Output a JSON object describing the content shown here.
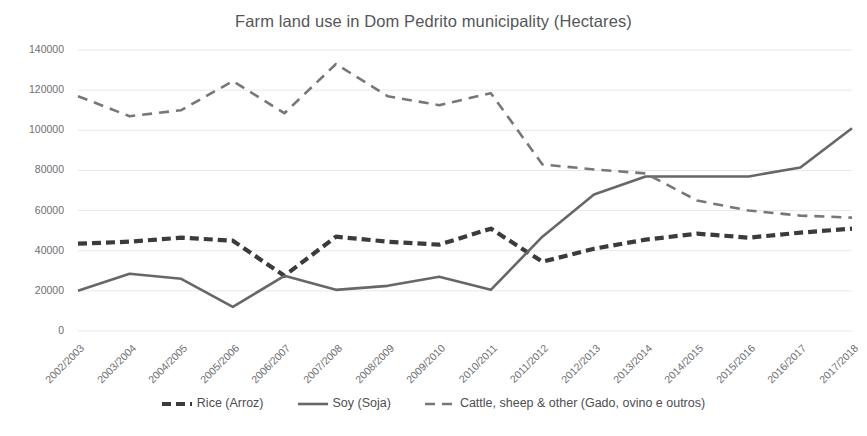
{
  "chart_data": {
    "type": "line",
    "title": "Farm land use in Dom Pedrito municipality (Hectares)",
    "xlabel": "",
    "ylabel": "",
    "ylim": [
      0,
      140000
    ],
    "ytick_step": 20000,
    "yticks": [
      "0",
      "20000",
      "40000",
      "60000",
      "80000",
      "100000",
      "120000",
      "140000"
    ],
    "grid": true,
    "legend_position": "bottom",
    "categories": [
      "2002/2003",
      "2003/2004",
      "2004/2005",
      "2005/2006",
      "2006/2007",
      "2007/2008",
      "2008/2009",
      "2009/2010",
      "2010/2011",
      "2011/2012",
      "2012/2013",
      "2013/2014",
      "2014/2015",
      "2015/2016",
      "2016/2017",
      "2017/2018"
    ],
    "series": [
      {
        "name": "Rice (Arroz)",
        "style": "dashed-thick",
        "color": "#3b3b3d",
        "values": [
          43500,
          44500,
          46500,
          45000,
          27500,
          47000,
          44500,
          43000,
          51000,
          34500,
          41000,
          45500,
          48500,
          46500,
          49000,
          51000
        ]
      },
      {
        "name": "Soy (Soja)",
        "style": "solid",
        "color": "#666768",
        "values": [
          20000,
          28500,
          26000,
          12000,
          27500,
          20500,
          22500,
          27000,
          20500,
          47000,
          68000,
          77000,
          77000,
          77000,
          81500,
          101000
        ]
      },
      {
        "name": "Cattle, sheep & other (Gado, ovino e outros)",
        "style": "dashed-long",
        "color": "#76777a",
        "values": [
          117000,
          107000,
          110000,
          124500,
          108500,
          133000,
          117000,
          112500,
          118500,
          83000,
          80500,
          78500,
          65000,
          60000,
          57500,
          56500
        ]
      }
    ]
  },
  "legend": {
    "items": [
      {
        "label": "Rice (Arroz)"
      },
      {
        "label": "Soy (Soja)"
      },
      {
        "label": "Cattle, sheep & other (Gado, ovino e outros)"
      }
    ]
  }
}
